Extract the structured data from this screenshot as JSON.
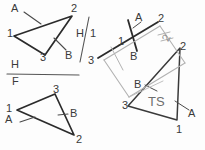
{
  "sketch": {
    "title": "Descriptive geometry triangle true-size construction",
    "colors": {
      "ink_dark": "#2b2b2b",
      "ink_medium": "#4a4a4a",
      "ink_light": "#9a9a9a",
      "paper": "#fdfdfd",
      "label": "#3a3a3a"
    }
  },
  "top_view": {
    "name": "top-view-triangle",
    "vertices": [
      {
        "id": "v1",
        "label": "1",
        "x": 14,
        "y": 34
      },
      {
        "id": "v2",
        "label": "2",
        "x": 72,
        "y": 12
      },
      {
        "id": "v3",
        "label": "3",
        "x": 43,
        "y": 56
      }
    ],
    "point_labels": [
      {
        "label": "A",
        "x": 13,
        "y": 4
      },
      {
        "label": "B",
        "x": 66,
        "y": 51
      }
    ],
    "leaders": [
      {
        "from": "A",
        "x1": 24,
        "y1": 12,
        "x2": 40,
        "y2": 23
      },
      {
        "from": "B",
        "x1": 65,
        "y1": 50,
        "x2": 53,
        "y2": 40
      }
    ]
  },
  "fold_line_h1": {
    "name": "fold-line-h-1",
    "upper_label": "H",
    "lower_label": "1",
    "upper_x": 78,
    "upper_y": 30,
    "lower_x": 92,
    "lower_y": 31
  },
  "fold_line_hf": {
    "name": "fold-line-h-f",
    "upper_label": "H",
    "lower_label": "F",
    "upper_x": 12,
    "upper_y": 62,
    "lower_x": 13,
    "lower_y": 79
  },
  "front_view": {
    "name": "front-view-triangle",
    "vertices": [
      {
        "id": "v1",
        "label": "1",
        "x": 10,
        "y": 108
      },
      {
        "id": "v3",
        "label": "3",
        "x": 54,
        "y": 92
      },
      {
        "id": "v2",
        "label": "2",
        "x": 76,
        "y": 137
      }
    ],
    "point_labels": [
      {
        "label": "A",
        "x": 9,
        "y": 118
      },
      {
        "label": "B",
        "x": 70,
        "y": 111
      }
    ],
    "leaders": [
      {
        "from": "A",
        "x1": 21,
        "y1": 122,
        "x2": 33,
        "y2": 117
      },
      {
        "from": "B",
        "x1": 69,
        "y1": 114,
        "x2": 59,
        "y2": 116
      }
    ]
  },
  "aux_view_1": {
    "name": "auxiliary-view-edge",
    "vertices": [
      {
        "id": "v3",
        "label": "3",
        "x": 92,
        "y": 58
      },
      {
        "id": "v2",
        "label": "2",
        "x": 160,
        "y": 20
      }
    ],
    "point_labels": [
      {
        "label": "A",
        "x": 136,
        "y": 17
      },
      {
        "label": "B",
        "x": 131,
        "y": 52
      },
      {
        "label": "1",
        "x": 118,
        "y": 38
      }
    ]
  },
  "aux_box": {
    "name": "auxiliary-fold-box",
    "rotated_label": "2"
  },
  "true_size_view": {
    "name": "true-size-triangle",
    "vertices": [
      {
        "id": "v3",
        "label": "3",
        "x": 125,
        "y": 104
      },
      {
        "id": "v2",
        "label": "2",
        "x": 182,
        "y": 45
      },
      {
        "id": "v1",
        "label": "1",
        "x": 177,
        "y": 125
      }
    ],
    "annotation": "TS",
    "annotation_x": 152,
    "annotation_y": 99,
    "point_labels": [
      {
        "label": "B",
        "x": 135,
        "y": 82
      },
      {
        "label": "A",
        "x": 188,
        "y": 110
      }
    ],
    "leaders": [
      {
        "from": "B",
        "x1": 146,
        "y1": 85,
        "x2": 155,
        "y2": 90
      },
      {
        "from": "A",
        "x1": 187,
        "y1": 110,
        "x2": 174,
        "y2": 101
      }
    ]
  }
}
